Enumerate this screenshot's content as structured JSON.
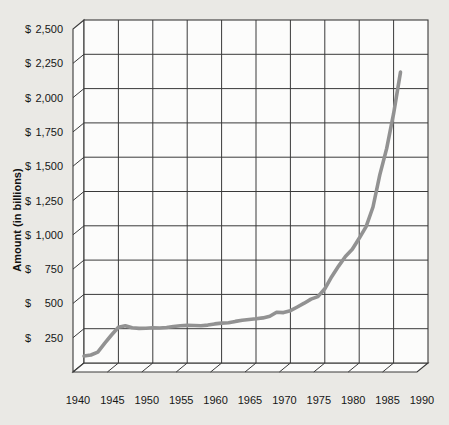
{
  "chart_data": {
    "type": "line",
    "title": "",
    "xlabel": "",
    "ylabel": "Amount (in billions)",
    "xlim": [
      1940,
      1990
    ],
    "ylim": [
      0,
      2500
    ],
    "grid": "on",
    "legend": "none",
    "x_tick_values": [
      1940,
      1945,
      1950,
      1955,
      1960,
      1965,
      1970,
      1975,
      1980,
      1985,
      1990
    ],
    "x_tick_labels": [
      "1940",
      "1945",
      "1950",
      "1955",
      "1960",
      "1965",
      "1970",
      "1975",
      "1980",
      "1985",
      "1990"
    ],
    "y_tick_values": [
      250,
      500,
      750,
      1000,
      1250,
      1500,
      1750,
      2000,
      2250,
      2500
    ],
    "y_tick_labels": [
      "$ 250",
      "$ 500",
      "$ 750",
      "$1,000",
      "$1,250",
      "$1,500",
      "$1,750",
      "$2,000",
      "$2,250",
      "$2,500"
    ],
    "currency_prefix": "$",
    "series": [
      {
        "x": [
          1940,
          1941,
          1942,
          1943,
          1944,
          1945,
          1946,
          1947,
          1948,
          1949,
          1950,
          1951,
          1952,
          1953,
          1954,
          1955,
          1956,
          1957,
          1958,
          1959,
          1960,
          1961,
          1962,
          1963,
          1964,
          1965,
          1966,
          1967,
          1968,
          1969,
          1970,
          1971,
          1972,
          1973,
          1974,
          1975,
          1976,
          1977,
          1978,
          1979,
          1980,
          1981,
          1982,
          1983,
          1984,
          1985,
          1986
        ],
        "values": [
          51,
          58,
          79,
          143,
          204,
          260,
          271,
          257,
          252,
          253,
          257,
          255,
          259,
          266,
          271,
          274,
          273,
          271,
          276,
          285,
          291,
          293,
          303,
          311,
          317,
          322,
          329,
          341,
          370,
          367,
          381,
          408,
          436,
          466,
          484,
          541,
          629,
          706,
          776,
          829,
          909,
          994,
          1137,
          1371,
          1564,
          1817,
          2120
        ]
      }
    ],
    "colors": {
      "background": "#eae9e5",
      "plot_background": "#fcfcfb",
      "grid": "#3a3a3a",
      "line": "#929292",
      "text": "#161616"
    }
  }
}
